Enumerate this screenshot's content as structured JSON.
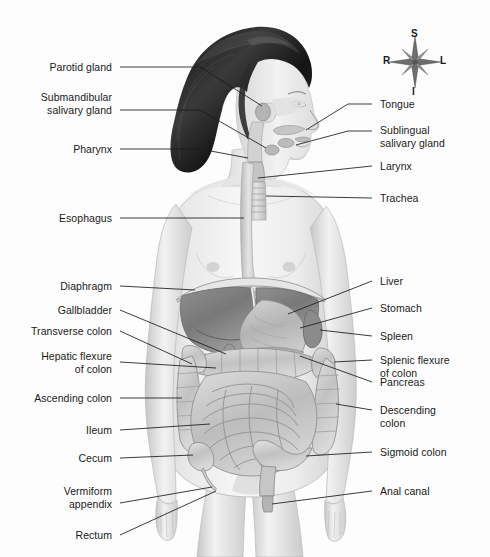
{
  "figure": {
    "background_color": "#fdfdfd",
    "line_color": "#1a1a1a",
    "text_color": "#1a1a1a"
  },
  "compass": {
    "name": "anatomical-orientation-rose",
    "superior": "S",
    "inferior": "I",
    "right": "R",
    "left": "L"
  },
  "labels_left": [
    {
      "key": "parotid-gland",
      "lines": [
        "Parotid gland"
      ],
      "text": "Parotid gland"
    },
    {
      "key": "submandibular-salivary-gland",
      "lines": [
        "Submandibular",
        "salivary gland"
      ],
      "text": "Submandibular\nsalivary gland"
    },
    {
      "key": "pharynx",
      "lines": [
        "Pharynx"
      ],
      "text": "Pharynx"
    },
    {
      "key": "esophagus",
      "lines": [
        "Esophagus"
      ],
      "text": "Esophagus"
    },
    {
      "key": "diaphragm",
      "lines": [
        "Diaphragm"
      ],
      "text": "Diaphragm"
    },
    {
      "key": "gallbladder",
      "lines": [
        "Gallbladder"
      ],
      "text": "Gallbladder"
    },
    {
      "key": "transverse-colon",
      "lines": [
        "Transverse colon"
      ],
      "text": "Transverse colon"
    },
    {
      "key": "hepatic-flexure-of-colon",
      "lines": [
        "Hepatic flexure",
        "of colon"
      ],
      "text": "Hepatic flexure\nof colon"
    },
    {
      "key": "ascending-colon",
      "lines": [
        "Ascending colon"
      ],
      "text": "Ascending colon"
    },
    {
      "key": "ileum",
      "lines": [
        "Ileum"
      ],
      "text": "Ileum"
    },
    {
      "key": "cecum",
      "lines": [
        "Cecum"
      ],
      "text": "Cecum"
    },
    {
      "key": "vermiform-appendix",
      "lines": [
        "Vermiform",
        "appendix"
      ],
      "text": "Vermiform\nappendix"
    },
    {
      "key": "rectum",
      "lines": [
        "Rectum"
      ],
      "text": "Rectum"
    }
  ],
  "labels_right": [
    {
      "key": "tongue",
      "lines": [
        "Tongue"
      ],
      "text": "Tongue"
    },
    {
      "key": "sublingual-salivary-gland",
      "lines": [
        "Sublingual",
        "salivary gland"
      ],
      "text": "Sublingual\nsalivary gland"
    },
    {
      "key": "larynx",
      "lines": [
        "Larynx"
      ],
      "text": "Larynx"
    },
    {
      "key": "trachea",
      "lines": [
        "Trachea"
      ],
      "text": "Trachea"
    },
    {
      "key": "liver",
      "lines": [
        "Liver"
      ],
      "text": "Liver"
    },
    {
      "key": "stomach",
      "lines": [
        "Stomach"
      ],
      "text": "Stomach"
    },
    {
      "key": "spleen",
      "lines": [
        "Spleen"
      ],
      "text": "Spleen"
    },
    {
      "key": "splenic-flexure-of-colon",
      "lines": [
        "Splenic flexure",
        "of colon"
      ],
      "text": "Splenic flexure\nof colon"
    },
    {
      "key": "pancreas",
      "lines": [
        "Pancreas"
      ],
      "text": "Pancreas"
    },
    {
      "key": "descending-colon",
      "lines": [
        "Descending",
        "colon"
      ],
      "text": "Descending\ncolon"
    },
    {
      "key": "sigmoid-colon",
      "lines": [
        "Sigmoid colon"
      ],
      "text": "Sigmoid colon"
    },
    {
      "key": "anal-canal",
      "lines": [
        "Anal canal"
      ],
      "text": "Anal canal"
    }
  ]
}
